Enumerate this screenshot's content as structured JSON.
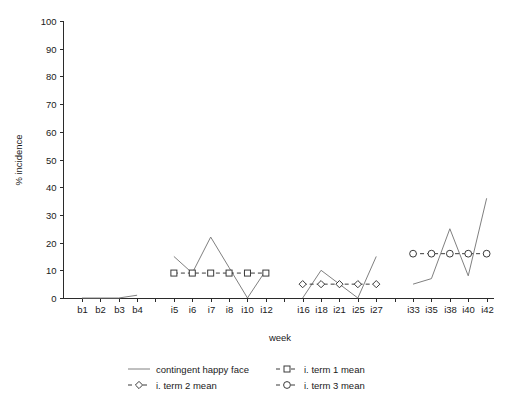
{
  "chart_data": {
    "type": "line",
    "title": "",
    "xlabel": "week",
    "ylabel": "% incidence",
    "ylim": [
      0,
      100
    ],
    "ytick_values": [
      0,
      10,
      20,
      30,
      40,
      50,
      60,
      70,
      80,
      90,
      100
    ],
    "ytick_labels": [
      "0",
      "10",
      "20",
      "30",
      "40",
      "50",
      "60",
      "70",
      "80",
      "90",
      "100"
    ],
    "grid": false,
    "legend_position": "bottom",
    "x_categories": [
      "b1",
      "b2",
      "b3",
      "b4",
      "",
      "i5",
      "i6",
      "i7",
      "i8",
      "i10",
      "i12",
      "",
      "i16",
      "i18",
      "i21",
      "i25",
      "i27",
      "",
      "i33",
      "i35",
      "i38",
      "i40",
      "i42"
    ],
    "x_tick_labels": [
      "b1",
      "b2",
      "b3",
      "b4",
      "i5",
      "i6",
      "i7",
      "i8",
      "i10",
      "i12",
      "i16",
      "i18",
      "i21",
      "i25",
      "i27",
      "i33",
      "i35",
      "i38",
      "i40",
      "i42"
    ],
    "series": [
      {
        "name": "contingent happy face",
        "marker": "none",
        "linestyle": "solid",
        "color": "#808080",
        "segments": [
          {
            "x": [
              "b1",
              "b2",
              "b3",
              "b4"
            ],
            "values": [
              0,
              0,
              0,
              1
            ]
          },
          {
            "x": [
              "i5",
              "i6",
              "i7",
              "i8",
              "i10",
              "i12"
            ],
            "values": [
              15,
              9,
              22,
              11,
              0,
              10
            ]
          },
          {
            "x": [
              "i16",
              "i18",
              "i21",
              "i25",
              "i27"
            ],
            "values": [
              0,
              10,
              5,
              0,
              15
            ]
          },
          {
            "x": [
              "i33",
              "i35",
              "i38",
              "i40",
              "i42"
            ],
            "values": [
              5,
              7,
              25,
              8,
              36
            ]
          }
        ]
      },
      {
        "name": "i. term 1 mean",
        "marker": "square",
        "linestyle": "dashed",
        "color": "#3a3a3a",
        "x": [
          "i5",
          "i6",
          "i7",
          "i8",
          "i10",
          "i12"
        ],
        "values": [
          9,
          9,
          9,
          9,
          9,
          9
        ]
      },
      {
        "name": "i. term 2 mean",
        "marker": "diamond",
        "linestyle": "dashed",
        "color": "#3a3a3a",
        "x": [
          "i16",
          "i18",
          "i21",
          "i25",
          "i27"
        ],
        "values": [
          5,
          5,
          5,
          5,
          5
        ]
      },
      {
        "name": "i. term 3 mean",
        "marker": "circle",
        "linestyle": "dashed",
        "color": "#3a3a3a",
        "x": [
          "i33",
          "i35",
          "i38",
          "i40",
          "i42"
        ],
        "values": [
          16,
          16,
          16,
          16,
          16
        ]
      }
    ],
    "legend_entries": [
      {
        "label": "contingent happy face",
        "marker": "none",
        "linestyle": "solid"
      },
      {
        "label": "i. term 1 mean",
        "marker": "square",
        "linestyle": "dashed"
      },
      {
        "label": "i. term 2 mean",
        "marker": "diamond",
        "linestyle": "dashed"
      },
      {
        "label": "i. term 3 mean",
        "marker": "circle",
        "linestyle": "dashed"
      }
    ]
  },
  "axes": {
    "y_label": "% incidence",
    "x_label": "week",
    "y_ticks": [
      "100",
      "90",
      "80",
      "70",
      "60",
      "50",
      "40",
      "30",
      "20",
      "10",
      "0"
    ],
    "x_ticks": [
      "b1",
      "b2",
      "b3",
      "b4",
      "i5",
      "i6",
      "i7",
      "i8",
      "i10",
      "i12",
      "i16",
      "i18",
      "i21",
      "i25",
      "i27",
      "i33",
      "i35",
      "i38",
      "i40",
      "i42"
    ]
  },
  "legend": {
    "entry_0": "contingent happy face",
    "entry_1": "i. term 1 mean",
    "entry_2": "i. term 2 mean",
    "entry_3": "i. term 3 mean"
  },
  "colors": {
    "solid_line": "#808080",
    "dashed_line": "#3a3a3a",
    "axis": "#2b2b2b",
    "text": "#1a1a1a",
    "background": "#ffffff"
  }
}
